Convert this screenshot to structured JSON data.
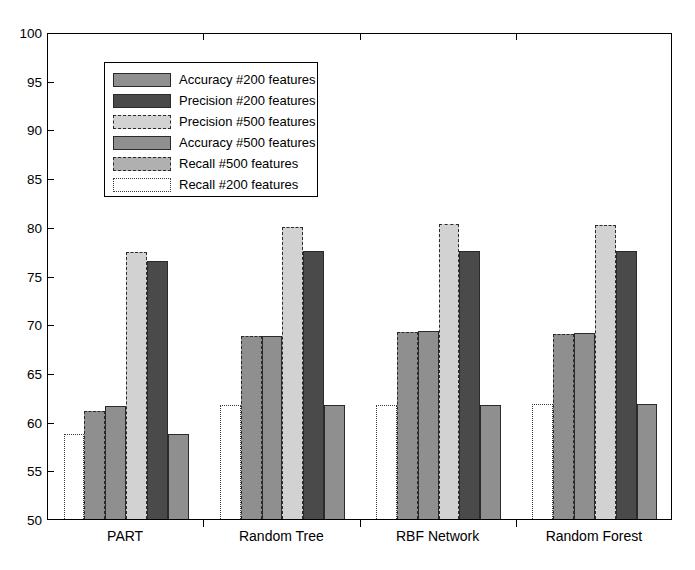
{
  "chart_data": {
    "type": "bar",
    "title": "",
    "xlabel": "",
    "ylabel": "",
    "ylim": [
      50,
      100
    ],
    "ytick_step": 5,
    "yticks": [
      "100",
      "95",
      "90",
      "85",
      "80",
      "75",
      "70",
      "65",
      "60",
      "55",
      "50"
    ],
    "grid": false,
    "legend_position": "upper-left-inside",
    "categories": [
      "PART",
      "Random Tree",
      "RBF Network",
      "Random Forest"
    ],
    "series": [
      {
        "name": "Recall #200 features",
        "legend_order": 6,
        "draw_order": 1,
        "fill": "#ffffff",
        "border": "#3a3a3a",
        "border_style": "dotted",
        "values": [
          58.8,
          61.8,
          61.8,
          61.9
        ]
      },
      {
        "name": "Accuracy #500 features",
        "legend_order": 4,
        "draw_order": 2,
        "fill": "#8f8f8f",
        "border": "#2b2b2b",
        "border_style": "dashed",
        "values": [
          61.1,
          68.9,
          69.3,
          69.1
        ]
      },
      {
        "name": "Accuracy #200 features",
        "legend_order": 1,
        "draw_order": 3,
        "fill": "#8f8f8f",
        "border": "#2b2b2b",
        "border_style": "solid",
        "values": [
          61.6,
          68.9,
          69.4,
          69.2
        ]
      },
      {
        "name": "Precision #500 features",
        "legend_order": 3,
        "draw_order": 4,
        "fill": "#d2d2d2",
        "border": "#2b2b2b",
        "border_style": "dashdot",
        "values": [
          77.5,
          80.1,
          80.4,
          80.3
        ]
      },
      {
        "name": "Precision #200 features",
        "legend_order": 2,
        "draw_order": 5,
        "fill": "#4a4a4a",
        "border": "#2b2b2b",
        "border_style": "solid",
        "values": [
          76.6,
          77.6,
          77.6,
          77.6
        ]
      },
      {
        "name": "Recall #500  features",
        "legend_order": 5,
        "draw_order": 6,
        "fill": "#8f8f8f",
        "border": "#2b2b2b",
        "border_style": "solid",
        "values": [
          58.8,
          61.8,
          61.8,
          61.9
        ]
      }
    ]
  },
  "legend": {
    "items": [
      {
        "label": "Accuracy #200 features",
        "fill": "#8f8f8f",
        "border": "#2b2b2b",
        "border_style": "solid"
      },
      {
        "label": "Precision #200 features",
        "fill": "#4a4a4a",
        "border": "#2b2b2b",
        "border_style": "solid"
      },
      {
        "label": "Precision #500 features",
        "fill": "#d2d2d2",
        "border": "#2b2b2b",
        "border_style": "dashdot"
      },
      {
        "label": "Accuracy #500 features",
        "fill": "#8f8f8f",
        "border": "#2b2b2b",
        "border_style": "solid"
      },
      {
        "label": "Recall #500  features",
        "fill": "#b0b0b0",
        "border": "#2b2b2b",
        "border_style": "dashed"
      },
      {
        "label": "Recall #200 features",
        "fill": "#ffffff",
        "border": "#3a3a3a",
        "border_style": "dotted"
      }
    ]
  }
}
